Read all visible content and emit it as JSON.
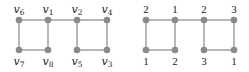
{
  "colors": {
    "node": "#8a8a8a",
    "edge": "#9a9a9a",
    "text": "#222222"
  },
  "left_graph": {
    "nodes": [
      {
        "id": "v6",
        "name": "v",
        "sub": "6",
        "x": 19,
        "y": 20,
        "label_pos": "top"
      },
      {
        "id": "v1",
        "name": "v",
        "sub": "1",
        "x": 48,
        "y": 20,
        "label_pos": "top"
      },
      {
        "id": "v2",
        "name": "v",
        "sub": "2",
        "x": 77,
        "y": 20,
        "label_pos": "top"
      },
      {
        "id": "v4",
        "name": "v",
        "sub": "4",
        "x": 107,
        "y": 20,
        "label_pos": "top"
      },
      {
        "id": "v7",
        "name": "v",
        "sub": "7",
        "x": 19,
        "y": 50,
        "label_pos": "bottom"
      },
      {
        "id": "v8",
        "name": "v",
        "sub": "8",
        "x": 48,
        "y": 50,
        "label_pos": "bottom"
      },
      {
        "id": "v5",
        "name": "v",
        "sub": "5",
        "x": 77,
        "y": 50,
        "label_pos": "bottom"
      },
      {
        "id": "v3",
        "name": "v",
        "sub": "3",
        "x": 107,
        "y": 50,
        "label_pos": "bottom"
      }
    ],
    "edges": [
      [
        "v6",
        "v1"
      ],
      [
        "v1",
        "v2"
      ],
      [
        "v2",
        "v4"
      ],
      [
        "v6",
        "v7"
      ],
      [
        "v7",
        "v8"
      ],
      [
        "v1",
        "v8"
      ],
      [
        "v2",
        "v5"
      ],
      [
        "v5",
        "v3"
      ],
      [
        "v4",
        "v3"
      ]
    ]
  },
  "right_graph": {
    "nodes": [
      {
        "id": "a",
        "label": "2",
        "x": 146,
        "y": 20,
        "label_pos": "top"
      },
      {
        "id": "b",
        "label": "1",
        "x": 175,
        "y": 20,
        "label_pos": "top"
      },
      {
        "id": "c",
        "label": "2",
        "x": 204,
        "y": 20,
        "label_pos": "top"
      },
      {
        "id": "d",
        "label": "3",
        "x": 234,
        "y": 20,
        "label_pos": "top"
      },
      {
        "id": "e",
        "label": "1",
        "x": 146,
        "y": 50,
        "label_pos": "bottom"
      },
      {
        "id": "f",
        "label": "2",
        "x": 175,
        "y": 50,
        "label_pos": "bottom"
      },
      {
        "id": "g",
        "label": "3",
        "x": 204,
        "y": 50,
        "label_pos": "bottom"
      },
      {
        "id": "h",
        "label": "1",
        "x": 234,
        "y": 50,
        "label_pos": "bottom"
      }
    ],
    "edges": [
      [
        "a",
        "b"
      ],
      [
        "b",
        "c"
      ],
      [
        "c",
        "d"
      ],
      [
        "a",
        "e"
      ],
      [
        "e",
        "f"
      ],
      [
        "b",
        "f"
      ],
      [
        "c",
        "g"
      ],
      [
        "g",
        "h"
      ],
      [
        "d",
        "h"
      ]
    ]
  }
}
